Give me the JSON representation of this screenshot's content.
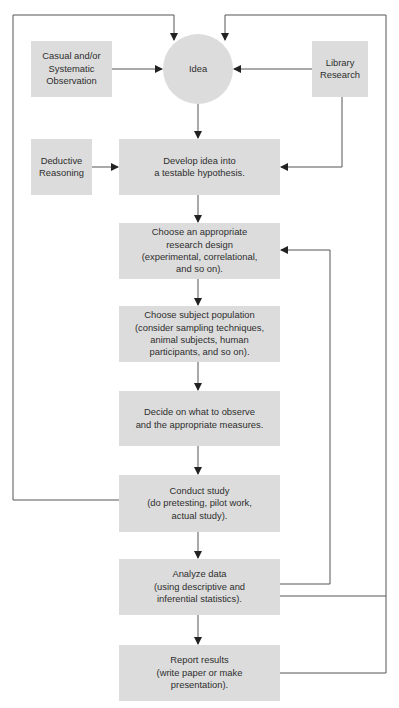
{
  "diagram": {
    "type": "flowchart",
    "colors": {
      "node_fill": "#dcdcdc",
      "line": "#555555",
      "text": "#2e2e2e"
    },
    "nodes": {
      "idea": "Idea",
      "observation": "Casual and/or\nSystematic\nObservation",
      "library": "Library\nResearch",
      "deductive": "Deductive\nReasoning",
      "hypothesis": "Develop idea into\na testable hypothesis.",
      "design": "Choose an appropriate\nresearch design\n(experimental, correlational,\nand so on).",
      "population": "Choose subject population\n(consider sampling techniques,\nanimal subjects, human\nparticipants, and so on).",
      "measures": "Decide on what to observe\nand the appropriate measures.",
      "conduct": "Conduct study\n(do pretesting, pilot work,\nactual study).",
      "analyze": "Analyze data\n(using descriptive and\ninferential statistics).",
      "report": "Report results\n(write paper or make\npresentation)."
    },
    "edges": [
      {
        "from": "observation",
        "to": "idea"
      },
      {
        "from": "library",
        "to": "idea"
      },
      {
        "from": "library",
        "to": "hypothesis"
      },
      {
        "from": "idea",
        "to": "hypothesis"
      },
      {
        "from": "deductive",
        "to": "hypothesis"
      },
      {
        "from": "hypothesis",
        "to": "design"
      },
      {
        "from": "design",
        "to": "population"
      },
      {
        "from": "population",
        "to": "measures"
      },
      {
        "from": "measures",
        "to": "conduct"
      },
      {
        "from": "conduct",
        "to": "analyze"
      },
      {
        "from": "analyze",
        "to": "report"
      },
      {
        "from": "conduct",
        "to": "idea",
        "kind": "feedback-loop-left"
      },
      {
        "from": "analyze",
        "to": "design",
        "kind": "feedback-loop-inner"
      },
      {
        "from": "analyze",
        "to": "idea",
        "kind": "feedback-loop-right"
      },
      {
        "from": "report",
        "to": "idea",
        "kind": "feedback-loop-right"
      }
    ]
  }
}
